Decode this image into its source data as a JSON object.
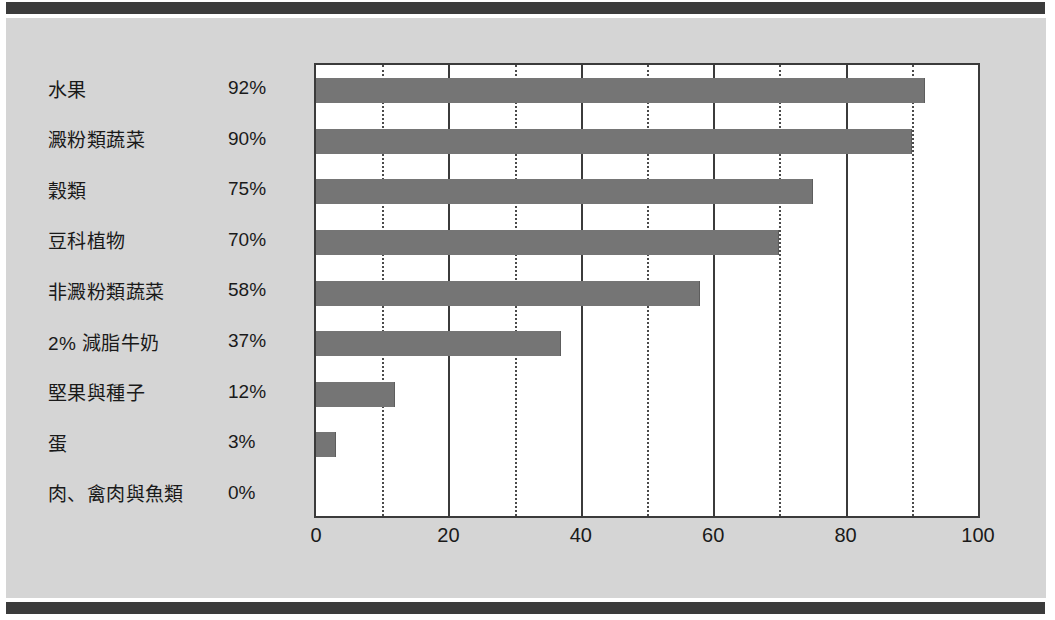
{
  "page": {
    "background_color": "#d5d5d5",
    "rule_color": "#3b3b3b",
    "plot_background": "#ffffff"
  },
  "chart_data": {
    "type": "bar",
    "orientation": "horizontal",
    "title": "",
    "subtitle": "",
    "xlabel": "",
    "ylabel": "",
    "xlim": [
      0,
      100
    ],
    "ylim": null,
    "grid": true,
    "grid_major_step": 20,
    "grid_minor_step": 10,
    "legend": false,
    "legend_position": "none",
    "bar_color": "#757575",
    "categories": [
      "水果",
      "澱粉類蔬菜",
      "穀類",
      "豆科植物",
      "非澱粉類蔬菜",
      "2% 減脂牛奶",
      "堅果與種子",
      "蛋",
      "肉、禽肉與魚類"
    ],
    "values": [
      92,
      90,
      75,
      70,
      58,
      37,
      12,
      3,
      0
    ],
    "value_labels": [
      "92%",
      "90%",
      "75%",
      "70%",
      "58%",
      "37%",
      "12%",
      "3%",
      "0%"
    ],
    "xticks": [
      0,
      20,
      40,
      60,
      80,
      100
    ],
    "xtick_labels": [
      "0",
      "20",
      "40",
      "60",
      "80",
      "100"
    ],
    "minor_xticks": [
      10,
      30,
      50,
      70,
      90
    ]
  }
}
